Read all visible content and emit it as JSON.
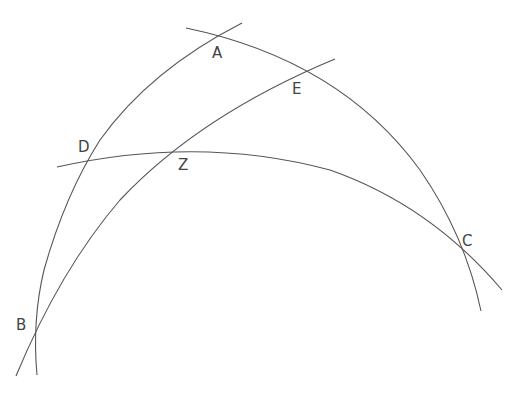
{
  "diagram": {
    "type": "spherical-triangle-construction",
    "stroke_color": "#555555",
    "label_color": "#444444",
    "points": [
      {
        "id": "A",
        "label": "A",
        "x": 218,
        "y": 37,
        "label_x": 212,
        "label_y": 58
      },
      {
        "id": "E",
        "label": "E",
        "x": 298,
        "y": 72,
        "label_x": 292,
        "label_y": 94
      },
      {
        "id": "D",
        "label": "D",
        "x": 87,
        "y": 162,
        "label_x": 78,
        "label_y": 152
      },
      {
        "id": "Z",
        "label": "Z",
        "x": 170,
        "y": 148,
        "label_x": 178,
        "label_y": 170
      },
      {
        "id": "C",
        "label": "C",
        "x": 455,
        "y": 240,
        "label_x": 462,
        "label_y": 246
      },
      {
        "id": "B",
        "label": "B",
        "x": 39,
        "y": 323,
        "label_x": 16,
        "label_y": 330
      }
    ],
    "arcs": [
      {
        "name": "arc-A-E-C",
        "through": [
          "A",
          "E",
          "C"
        ]
      },
      {
        "name": "arc-B-D-A",
        "through": [
          "B",
          "D",
          "A"
        ]
      },
      {
        "name": "arc-B-Z-E",
        "through": [
          "B",
          "Z",
          "E"
        ]
      },
      {
        "name": "arc-D-Z-C",
        "through": [
          "D",
          "Z",
          "C"
        ]
      }
    ]
  }
}
